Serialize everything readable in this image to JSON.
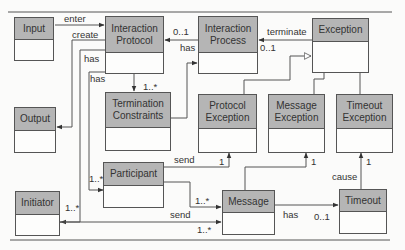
{
  "diagram": {
    "type": "UML class diagram",
    "classes": [
      {
        "id": "input",
        "name": "Input"
      },
      {
        "id": "interaction_protocol",
        "name": "Interaction Protocol"
      },
      {
        "id": "interaction_process",
        "name": "Interaction Process"
      },
      {
        "id": "exception",
        "name": "Exception"
      },
      {
        "id": "output",
        "name": "Output"
      },
      {
        "id": "termination_constraints",
        "name": "Termination Constraints"
      },
      {
        "id": "protocol_exception",
        "name": "Protocol Exception"
      },
      {
        "id": "message_exception",
        "name": "Message Exception"
      },
      {
        "id": "timeout_exception",
        "name": "Timeout Exception"
      },
      {
        "id": "participant",
        "name": "Participant"
      },
      {
        "id": "initiator",
        "name": "Initiator"
      },
      {
        "id": "message",
        "name": "Message"
      },
      {
        "id": "timeout",
        "name": "Timeout"
      }
    ],
    "labels": {
      "enter": "enter",
      "create": "create",
      "has_ip_1": "has",
      "has_ip_2": "has",
      "mult_tc": "1..*",
      "mult_ip_01": "0..1",
      "has_proc": "has",
      "terminate": "terminate",
      "mult_proc_01": "0..1",
      "send_pe": "send",
      "mult_pe_1": "1",
      "mult_part": "1..*",
      "mult_init": "1..*",
      "mult_msg_1": "1..*",
      "send_msg": "send",
      "mult_msg_2": "1..*",
      "has_timeout": "has",
      "mult_timeout": "0..1",
      "mult_me_1": "1",
      "cause": "cause",
      "mult_te_1": "1"
    },
    "relations": [
      {
        "from": "Input",
        "to": "Interaction Protocol",
        "label": "enter"
      },
      {
        "from": "Interaction Protocol",
        "to": "Output",
        "label": "create"
      },
      {
        "from": "Interaction Protocol",
        "to": "Initiator",
        "label": "has",
        "multiplicity": "1..*"
      },
      {
        "from": "Interaction Protocol",
        "to": "Participant",
        "label": "has",
        "multiplicity": "1..*"
      },
      {
        "from": "Interaction Protocol",
        "to": "Termination Constraints",
        "multiplicity": "1..*"
      },
      {
        "from": "Interaction Process",
        "to": "Interaction Protocol",
        "label": "has",
        "multiplicity": "0..1"
      },
      {
        "from": "Termination Constraints",
        "to": "Interaction Process"
      },
      {
        "from": "Exception",
        "to": "Interaction Process",
        "label": "terminate",
        "multiplicity": "0..1"
      },
      {
        "from": "Protocol Exception",
        "to": "Exception",
        "type": "generalization"
      },
      {
        "from": "Message Exception",
        "to": "Exception",
        "type": "generalization"
      },
      {
        "from": "Timeout Exception",
        "to": "Exception",
        "type": "generalization"
      },
      {
        "from": "Participant",
        "to": "Protocol Exception",
        "label": "send",
        "multiplicity": "1"
      },
      {
        "from": "Participant",
        "to": "Message",
        "multiplicity": "1..*"
      },
      {
        "from": "Initiator",
        "to": "Message",
        "label": "send",
        "multiplicity": "1..*"
      },
      {
        "from": "Message",
        "to": "Message Exception",
        "multiplicity": "1"
      },
      {
        "from": "Message",
        "to": "Timeout",
        "label": "has",
        "multiplicity": "0..1"
      },
      {
        "from": "Timeout",
        "to": "Timeout Exception",
        "label": "cause",
        "multiplicity": "1"
      }
    ]
  }
}
